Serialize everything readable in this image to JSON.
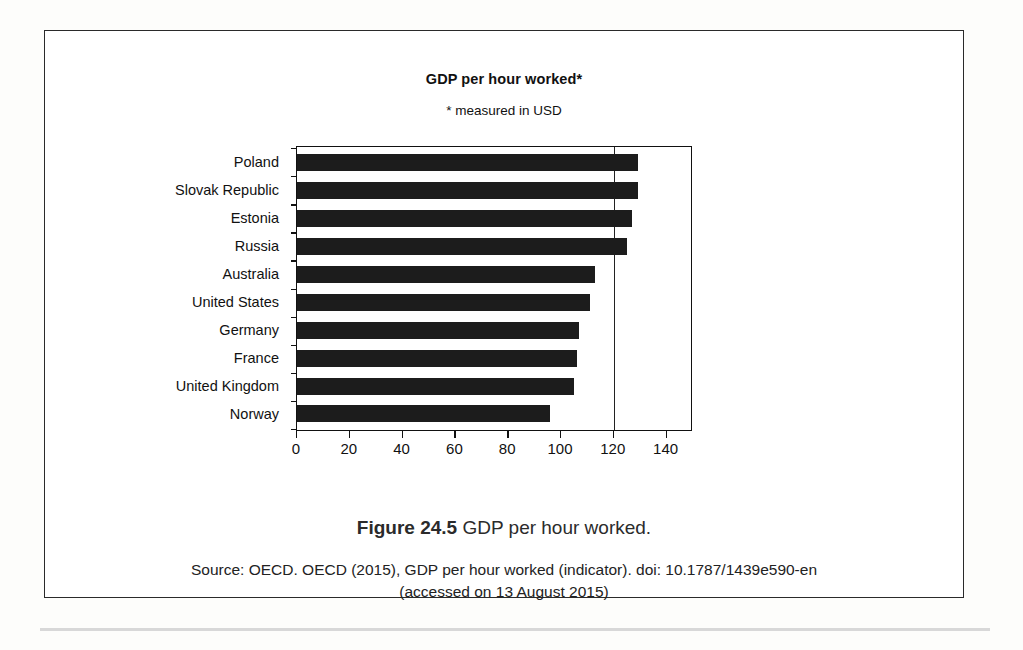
{
  "figure": {
    "caption_label": "Figure 24.5",
    "caption_text": "GDP per hour worked.",
    "source_line_1": "Source: OECD. OECD (2015), GDP per hour worked (indicator). doi: 10.1787/1439e590-en",
    "source_line_2": "(accessed on 13 August 2015)"
  },
  "chart_data": {
    "type": "bar",
    "orientation": "horizontal",
    "title": "GDP per hour worked*",
    "subtitle": "* measured in USD",
    "xlabel": "",
    "ylabel": "",
    "xlim": [
      0,
      150
    ],
    "xticks": [
      0,
      20,
      40,
      60,
      80,
      100,
      120,
      140
    ],
    "xtick_labels": [
      "0",
      "20",
      "40",
      "60",
      "80",
      "100",
      "120",
      "140"
    ],
    "grid": false,
    "gridline_at": 120,
    "legend": null,
    "bar_color": "#1c1c1c",
    "categories": [
      "Poland",
      "Slovak Republic",
      "Estonia",
      "Russia",
      "Australia",
      "United States",
      "Germany",
      "France",
      "United Kingdom",
      "Norway"
    ],
    "values": [
      129,
      129,
      127,
      125,
      113,
      111,
      107,
      106,
      105,
      96
    ]
  }
}
